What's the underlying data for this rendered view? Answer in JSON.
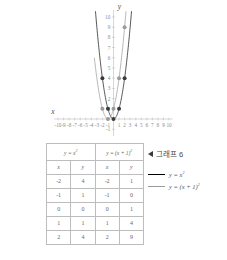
{
  "chart_data": {
    "type": "line",
    "title": "",
    "xlabel": "x",
    "ylabel": "y",
    "xlim": [
      -10.5,
      10.5
    ],
    "ylim": [
      -1.6,
      10.8
    ],
    "grid": false,
    "x_ticks": [
      -10,
      -9,
      -8,
      -7,
      -6,
      -5,
      -4,
      -3,
      -2,
      -1,
      1,
      2,
      3,
      4,
      5,
      6,
      7,
      8,
      9,
      10
    ],
    "x_tick_labels": [
      "-10",
      "-9",
      "-8",
      "-7",
      "-6",
      "-5",
      "-4",
      "-3",
      "-2",
      "-1",
      "1",
      "2",
      "3",
      "4",
      "5",
      "6",
      "7",
      "8",
      "9",
      "10"
    ],
    "y_ticks": [
      -1,
      1,
      2,
      3,
      4,
      5,
      6,
      7,
      8,
      9,
      10
    ],
    "y_tick_labels": [
      "-1",
      "1",
      "2",
      "3",
      "4",
      "5",
      "6",
      "7",
      "8",
      "9",
      "10"
    ],
    "series": [
      {
        "name": "y = x²",
        "color": "#3a3a3a",
        "equation_a": 1,
        "equation_h": 0,
        "points": [
          {
            "x": -2,
            "y": 4
          },
          {
            "x": -1,
            "y": 1
          },
          {
            "x": 0,
            "y": 0
          },
          {
            "x": 1,
            "y": 1
          },
          {
            "x": 2,
            "y": 4
          }
        ]
      },
      {
        "name": "y = (x + 1)²",
        "color": "#9a9a9a",
        "equation_a": 1,
        "equation_h": -1,
        "points": [
          {
            "x": -2,
            "y": 1
          },
          {
            "x": -1,
            "y": 0
          },
          {
            "x": 0,
            "y": 1
          },
          {
            "x": 1,
            "y": 4
          },
          {
            "x": 2,
            "y": 9
          }
        ]
      }
    ],
    "legend_position": "right"
  },
  "axes": {
    "x_label": "x",
    "y_label": "y"
  },
  "table": {
    "headers": [
      "y = x²",
      "y = (x + 1)²"
    ],
    "header_left_base": "y = x",
    "header_left_sup": "2",
    "header_right_base": "y = (x + 1)",
    "header_right_sup": "2",
    "sub_headers": [
      "x",
      "y",
      "x",
      "y"
    ],
    "rows": [
      [
        "-2",
        "4",
        "-2",
        "1"
      ],
      [
        "-1",
        "1",
        "-1",
        "0"
      ],
      [
        "0",
        "0",
        "0",
        "1"
      ],
      [
        "1",
        "1",
        "1",
        "4"
      ],
      [
        "2",
        "4",
        "2",
        "9"
      ]
    ]
  },
  "legend": {
    "title": "그래프 6",
    "marker_icon": "left-triangle-icon",
    "entries": [
      {
        "label_base": "y = x",
        "label_sup": "2",
        "color": "#3a3a3a",
        "style": "dark"
      },
      {
        "label_base": "y = (x + 1)",
        "label_sup": "2",
        "color": "#9a9a9a",
        "style": "light"
      }
    ]
  }
}
